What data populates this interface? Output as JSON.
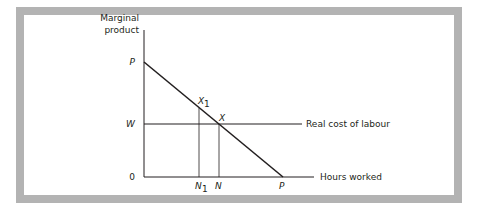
{
  "diagram": {
    "y_axis_label_line1": "Marginal",
    "y_axis_label_line2": "product",
    "x_axis_label": "Hours worked",
    "wage_line_label": "Real cost of labour",
    "origin_label": "0",
    "y_intercept_label": "P",
    "x_intercept_label": "P",
    "wage_label": "W",
    "point_x_label": "X",
    "point_x1_label": "X",
    "point_x1_subscript": "1",
    "n_label": "N",
    "n1_label": "N",
    "n1_subscript": "1"
  },
  "colors": {
    "frame": "#b3b3b3",
    "line": "#231f20"
  }
}
